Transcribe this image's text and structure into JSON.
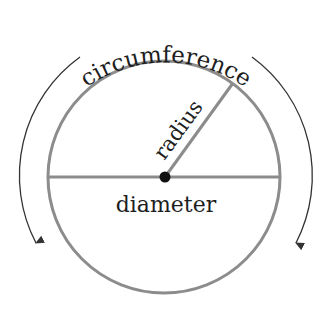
{
  "diagram": {
    "labels": {
      "circumference": "circumference",
      "radius": "radius",
      "diameter": "diameter"
    },
    "colors": {
      "circle_stroke": "#8c8c8c",
      "arc_stroke": "#333333",
      "text": "#1e1e1e",
      "center_dot": "#111111",
      "background": "#ffffff"
    },
    "elements": [
      {
        "id": "circle",
        "type": "circle",
        "description": "main circle outline"
      },
      {
        "id": "diameter-line",
        "type": "line",
        "description": "horizontal line through center"
      },
      {
        "id": "radius-line",
        "type": "line",
        "description": "line from center to upper-right edge"
      },
      {
        "id": "center-point",
        "type": "dot",
        "description": "center of circle"
      },
      {
        "id": "left-arrow-arc",
        "type": "arrow",
        "description": "curved arrow along left side pointing down"
      },
      {
        "id": "right-arrow-arc",
        "type": "arrow",
        "description": "curved arrow along right side pointing down"
      }
    ]
  }
}
